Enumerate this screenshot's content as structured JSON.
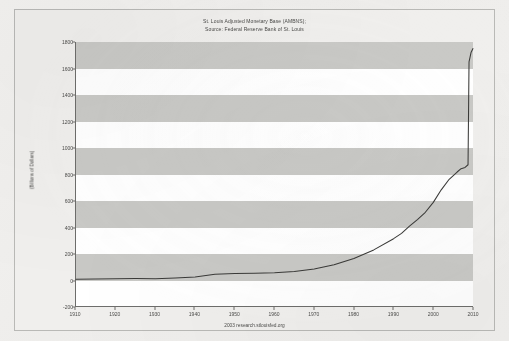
{
  "figure": {
    "title_line1": "St. Louis Adjusted Monetary Base (AMBNS);",
    "title_line2": "Source: Federal Reserve Bank of St. Louis",
    "footer_caption": "2003 research.stlouisfed.org"
  },
  "chart_data": {
    "type": "line",
    "title": "St. Louis Adjusted Monetary Base (AMBNS); Source: Federal Reserve Bank of St. Louis",
    "subtitle": "Source: Federal Reserve Bank of St. Louis",
    "xlabel": "",
    "ylabel": "(Billions of Dollars)",
    "xlim": [
      1910,
      2010
    ],
    "ylim": [
      -200,
      1800
    ],
    "grid": false,
    "banding": "alternating horizontal gray bands every 200 units",
    "legend": "none",
    "annotation": "2003 research.stlouisfed.org",
    "xticks": [
      1910,
      1920,
      1930,
      1940,
      1950,
      1960,
      1970,
      1980,
      1990,
      2000,
      2010
    ],
    "yticks": [
      -200,
      0,
      200,
      400,
      600,
      800,
      1000,
      1200,
      1400,
      1600,
      1800
    ],
    "series": [
      {
        "name": "St. Louis Adjusted Monetary Base",
        "x": [
          1910,
          1915,
          1920,
          1925,
          1930,
          1935,
          1940,
          1945,
          1950,
          1955,
          1960,
          1965,
          1970,
          1975,
          1980,
          1985,
          1990,
          1992,
          1994,
          1996,
          1998,
          2000,
          2002,
          2004,
          2006,
          2007,
          2008,
          2008.75,
          2009,
          2009.5,
          2010
        ],
        "values": [
          3,
          4,
          7,
          8,
          7,
          12,
          20,
          40,
          46,
          48,
          52,
          62,
          80,
          112,
          160,
          225,
          310,
          350,
          405,
          455,
          510,
          585,
          680,
          760,
          815,
          840,
          850,
          870,
          1650,
          1720,
          1750
        ]
      }
    ]
  },
  "y_axis": {
    "ticks": [
      "1800",
      "1600",
      "1400",
      "1200",
      "1000",
      "800",
      "600",
      "400",
      "200",
      "0",
      "-200"
    ],
    "title": "(Billions of Dollars)"
  },
  "x_axis": {
    "ticks": [
      "1910",
      "1920",
      "1930",
      "1940",
      "1950",
      "1960",
      "1970",
      "1980",
      "1990",
      "2000",
      "2010"
    ]
  },
  "colors": {
    "band": "#c9c9c6",
    "plot_bg": "#ffffff",
    "series_line": "#3a3a38",
    "axis": "#6d6d6b",
    "paper": "#f1f0ee"
  }
}
